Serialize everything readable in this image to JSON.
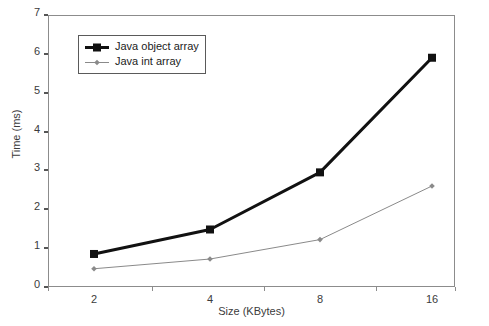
{
  "chart_data": {
    "type": "line",
    "title": "",
    "xlabel": "Size (KBytes)",
    "ylabel": "Time (ms)",
    "categories": [
      "2",
      "4",
      "8",
      "16"
    ],
    "x": [
      2,
      4,
      8,
      16
    ],
    "xlim": [
      0,
      4
    ],
    "ylim": [
      0,
      7
    ],
    "yticks": [
      0,
      1,
      2,
      3,
      4,
      5,
      6,
      7
    ],
    "yticklabels": [
      "0",
      "1",
      "2",
      "3",
      "4",
      "5",
      "6",
      "7"
    ],
    "xticklabels": [
      "2",
      "4",
      "8",
      "16"
    ],
    "grid": false,
    "legend_position": "upper-left-inside",
    "series": [
      {
        "name": "Java object array",
        "values": [
          0.85,
          1.48,
          2.95,
          5.9
        ],
        "color": "#111111",
        "line_width": 3,
        "marker": "square"
      },
      {
        "name": "Java int array",
        "values": [
          0.47,
          0.72,
          1.22,
          2.6
        ],
        "color": "#8a8a8a",
        "line_width": 1,
        "marker": "diamond"
      }
    ]
  },
  "axes": {
    "frame_color": "#8c8c8c",
    "tick_color": "#555555",
    "label_color": "#3b3b3b"
  },
  "legend": {
    "entries": [
      {
        "label": "Java object array"
      },
      {
        "label": "Java int array"
      }
    ]
  }
}
